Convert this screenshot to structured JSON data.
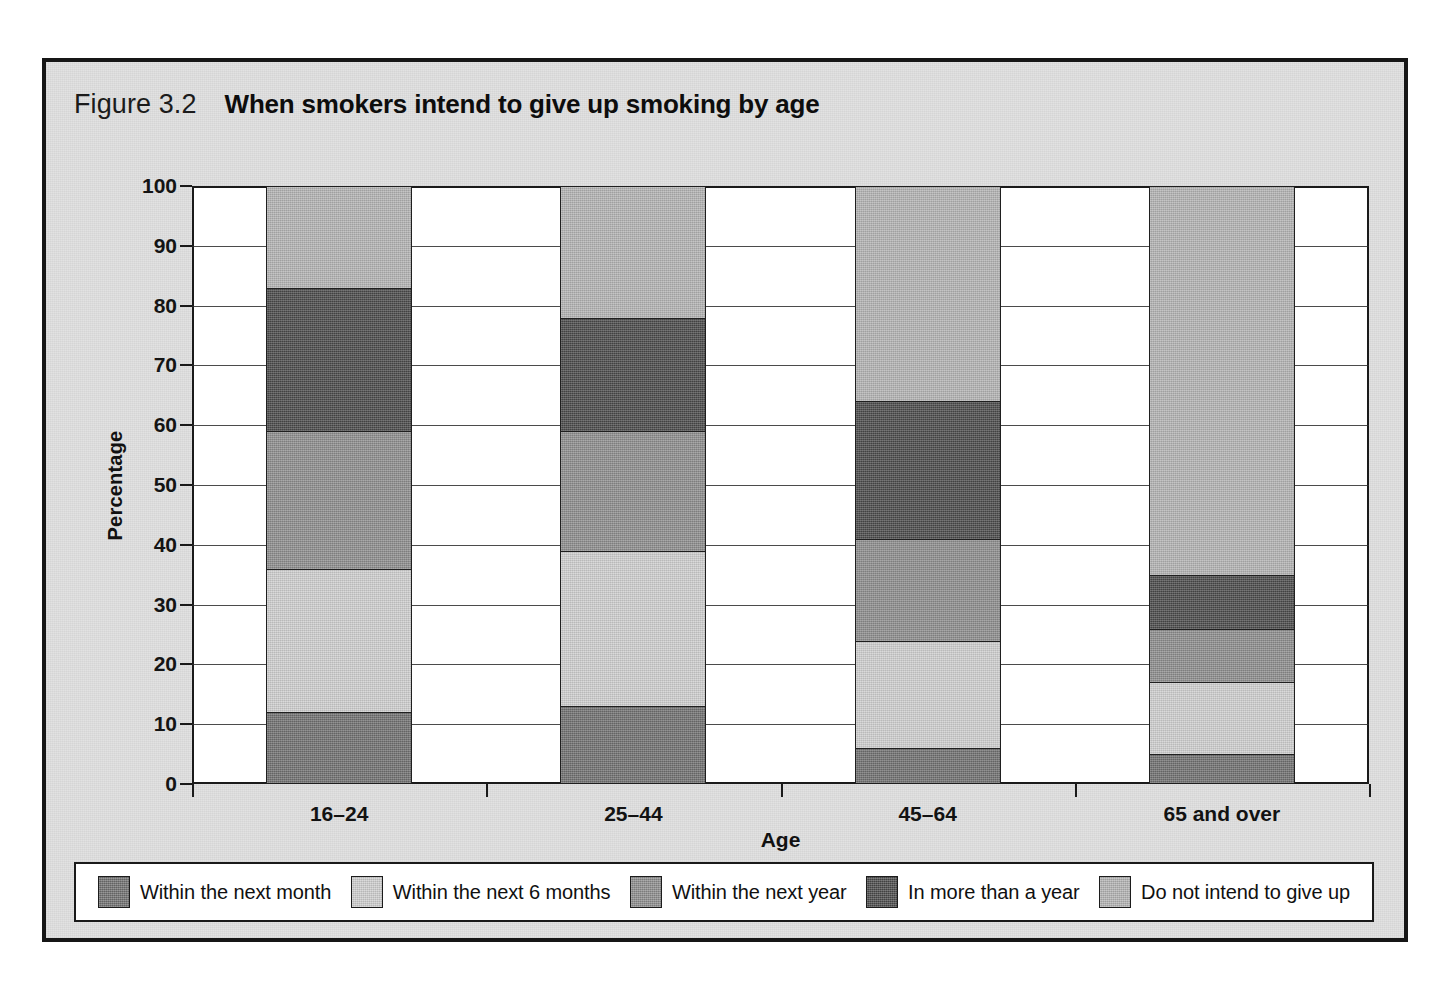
{
  "figure": {
    "number": "Figure 3.2",
    "title": "When smokers intend to give up smoking by age"
  },
  "chart_data": {
    "type": "bar",
    "subtype": "stacked-vertical-100",
    "title": "When smokers intend to give up smoking by age",
    "xlabel": "Age",
    "ylabel": "Percentage",
    "ylim": [
      0,
      100
    ],
    "yticks": [
      0,
      10,
      20,
      30,
      40,
      50,
      60,
      70,
      80,
      90,
      100
    ],
    "grid": true,
    "legend_position": "bottom",
    "categories": [
      "16–24",
      "25–44",
      "45–64",
      "65 and over"
    ],
    "series": [
      {
        "name": "Within the next month",
        "color": "#6f6f6f",
        "values": [
          12,
          13,
          6,
          5
        ]
      },
      {
        "name": "Within the next 6 months",
        "color": "#cecece",
        "values": [
          24,
          26,
          18,
          12
        ]
      },
      {
        "name": "Within the next year",
        "color": "#8c8c8c",
        "values": [
          23,
          20,
          17,
          9
        ]
      },
      {
        "name": "In more than a year",
        "color": "#4a4a4a",
        "values": [
          24,
          19,
          23,
          9
        ]
      },
      {
        "name": "Do not intend to give up",
        "color": "#b2b2b2",
        "values": [
          17,
          22,
          36,
          65
        ]
      }
    ],
    "cumulative_tops": {
      "16–24": [
        12,
        36,
        59,
        83,
        100
      ],
      "25–44": [
        13,
        39,
        59,
        78,
        100
      ],
      "45–64": [
        6,
        24,
        41,
        64,
        100
      ],
      "65 and over": [
        5,
        17,
        26,
        35,
        100
      ]
    }
  },
  "legend": {
    "items": [
      {
        "label": "Within the next month"
      },
      {
        "label": "Within the next 6 months"
      },
      {
        "label": "Within the next year"
      },
      {
        "label": "In more than a year"
      },
      {
        "label": "Do not intend to give up"
      }
    ]
  }
}
